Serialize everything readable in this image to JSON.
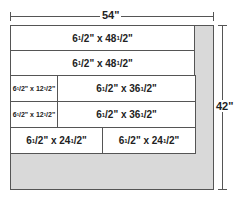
{
  "dimensions": {
    "width_label": "54\"",
    "height_label": "42\""
  },
  "pieces": [
    {
      "label_main": "6",
      "label_rest": "/2\" x 48",
      "label_end": "/2\""
    },
    {
      "label_main": "6",
      "label_rest": "/2\" x 48",
      "label_end": "/2\""
    },
    {
      "label_main": "6",
      "label_rest": "/2\" x 12",
      "label_end": "/2\""
    },
    {
      "label_main": "6",
      "label_rest": "/2\" x 36",
      "label_end": "/2\""
    },
    {
      "label_main": "6",
      "label_rest": "/2\" x 12",
      "label_end": "/2\""
    },
    {
      "label_main": "6",
      "label_rest": "/2\" x 36",
      "label_end": "/2\""
    },
    {
      "label_main": "6",
      "label_rest": "/2\" x 24",
      "label_end": "/2\""
    },
    {
      "label_main": "6",
      "label_rest": "/2\" x 24",
      "label_end": "/2\""
    }
  ],
  "sup": "1",
  "colors": {
    "waste": "#d9d9d9",
    "line": "#555555"
  }
}
